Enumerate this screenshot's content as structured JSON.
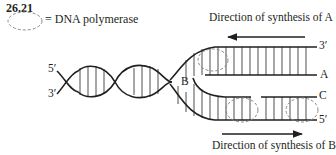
{
  "figure": {
    "number": "26.21",
    "legend": {
      "symbol": "dashed-ellipse",
      "text": "= DNA polymerase"
    },
    "directions": {
      "top": "Direction of synthesis of A",
      "bottom": "Direction of synthesis of B"
    },
    "labels": {
      "helix_5prime": "5′",
      "helix_3prime": "3′",
      "fork": "B",
      "top_strand_end": "3′",
      "strand_a": "A",
      "strand_c": "C",
      "bottom_strand_end": "5′"
    },
    "colors": {
      "line": "#231f20",
      "polymerase": "#8a8a8a"
    }
  }
}
